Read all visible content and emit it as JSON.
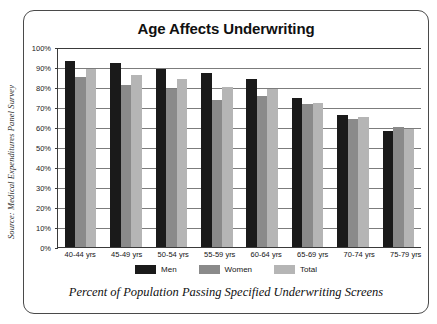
{
  "figure": {
    "title": "Age Affects Underwriting",
    "caption": "Percent of Population Passing Specified Underwriting Screens",
    "source_credit": "Source: Medical Expenditures Panel Survey"
  },
  "colors": {
    "men": "#1a1a1a",
    "women": "#8a8a8a",
    "total": "#b5b5b5",
    "frame": "#4a4a4a",
    "axis": "#3a3a3a",
    "gridline": "#7c7c7c",
    "background": "#ffffff"
  },
  "chart_data": {
    "type": "bar",
    "title": "Age Affects Underwriting",
    "subtitle": "Percent of Population Passing Specified Underwriting Screens",
    "xlabel": "",
    "ylabel": "",
    "ylim": [
      0,
      100
    ],
    "ytick_labels": [
      "100%",
      "90%",
      "80%",
      "70%",
      "60%",
      "50%",
      "40%",
      "30%",
      "20%",
      "10%",
      "0%"
    ],
    "ytick_values": [
      100,
      90,
      80,
      70,
      60,
      50,
      40,
      30,
      20,
      10,
      0
    ],
    "grid": true,
    "legend_position": "bottom",
    "categories": [
      "40-44 yrs",
      "45-49 yrs",
      "50-54 yrs",
      "55-59 yrs",
      "60-64 yrs",
      "65-69 yrs",
      "70-74 yrs",
      "75-79 yrs"
    ],
    "series": [
      {
        "name": "Men",
        "color": "#1a1a1a",
        "values": [
          93,
          92,
          89,
          87,
          84,
          74.5,
          66,
          58
        ]
      },
      {
        "name": "Women",
        "color": "#8a8a8a",
        "values": [
          85,
          81,
          79,
          73.5,
          75.5,
          71.5,
          64,
          60
        ]
      },
      {
        "name": "Total",
        "color": "#b5b5b5",
        "values": [
          89,
          86,
          84,
          80,
          79,
          72,
          65,
          59
        ]
      }
    ]
  }
}
